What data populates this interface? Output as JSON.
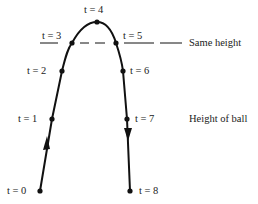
{
  "labels": {
    "t0": "t = 0",
    "t1": "t = 1",
    "t2": "t = 2",
    "t3": "t = 3",
    "t4": "t = 4",
    "t5": "t = 5",
    "t6": "t = 6",
    "t7": "t = 7",
    "t8": "t = 8",
    "same_height": "Same height",
    "height_of_ball": "Height of ball"
  },
  "colors": {
    "stroke": "#111111",
    "text": "#222222"
  }
}
